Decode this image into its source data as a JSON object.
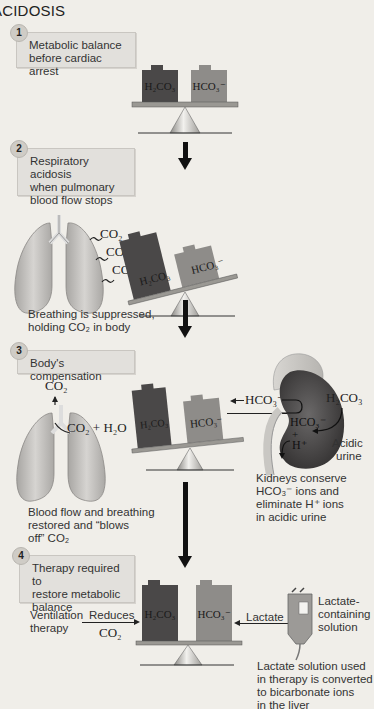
{
  "title": "ACIDOSIS",
  "colors": {
    "background": "#f0eee9",
    "stepbox": "#e2e0dc",
    "h2co3_weight": "#4a4848",
    "hco3_weight": "#8e8c89",
    "beam": "#9a9893",
    "lung": "#c8c6c3",
    "kidney": "#4c4a4a",
    "arrow": "#111111"
  },
  "steps": [
    {
      "number": "1",
      "text_line1": "Metabolic balance",
      "text_line2": "before cardiac arrest"
    },
    {
      "number": "2",
      "text_line1": "Respiratory acidosis",
      "text_line2": "when pulmonary",
      "text_line3": "blood flow stops"
    },
    {
      "number": "3",
      "text_line1": "Body's compensation"
    },
    {
      "number": "4",
      "text_line1": "Therapy required to",
      "text_line2": "restore metabolic",
      "text_line3": "balance"
    }
  ],
  "weights": {
    "acid": "H₂CO₃",
    "base": "HCO₃⁻"
  },
  "step2": {
    "co2_labels": [
      "CO₂",
      "CO₂",
      "CO₂"
    ],
    "caption_line1": "Breathing is suppressed,",
    "caption_line2": "holding CO₂ in body"
  },
  "step3": {
    "lung_co2_top": "CO₂",
    "lung_reaction": "CO₂ + H₂O",
    "lung_caption_line1": "Blood flow and breathing",
    "lung_caption_line2": "restored and “blows",
    "lung_caption_line3": "off” CO₂",
    "kidney_hco3_out": "HCO₃⁻",
    "kidney_hco3_inside": "HCO₃⁻",
    "kidney_h2co3": "H₂CO₃",
    "kidney_h_plus": "H⁺",
    "kidney_plus": "+",
    "acidic_urine_line1": "Acidic",
    "acidic_urine_line2": "urine",
    "kidney_caption_line1": "Kidneys conserve",
    "kidney_caption_line2": "HCO₃⁻ ions and",
    "kidney_caption_line3": "eliminate H⁺ ions",
    "kidney_caption_line4": "in acidic urine"
  },
  "step4": {
    "ventilation_line1": "Ventilation",
    "ventilation_line2": "therapy",
    "reduces": "Reduces",
    "reduces_co2": "CO₂",
    "lactate": "Lactate",
    "solution_line1": "Lactate-",
    "solution_line2": "containing",
    "solution_line3": "solution",
    "caption_line1": "Lactate solution used",
    "caption_line2": "in therapy is converted",
    "caption_line3": "to bicarbonate ions",
    "caption_line4": "in the liver"
  }
}
